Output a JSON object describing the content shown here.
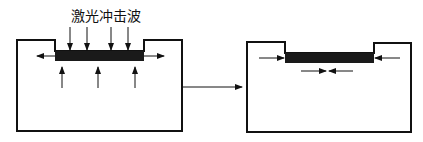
{
  "diagram": {
    "title": "",
    "label_shock_wave": "激光冲击波",
    "panels": [
      {
        "id": "before",
        "description": "Workpiece with laser shock wave applied; arrows show shock wave pressing down, material expanding outward and upward"
      },
      {
        "id": "after",
        "description": "Workpiece after treatment; arrows show residual compressive stress inward"
      }
    ],
    "colors": {
      "line": "#111111",
      "bar": "#1a1a1a",
      "background": "#ffffff"
    }
  }
}
